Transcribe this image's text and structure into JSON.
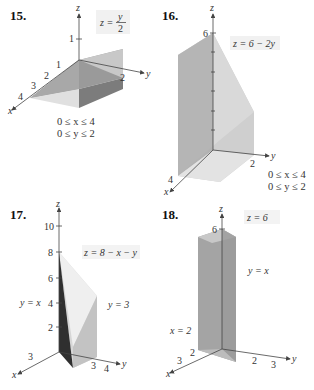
{
  "figures": [
    {
      "number": "15.",
      "equation": "z = y/2",
      "equation_lhs": "z =",
      "equation_num": "y",
      "equation_den": "2",
      "axes": {
        "x": "x",
        "y": "y",
        "z": "z"
      },
      "ticks": {
        "x": [
          "1",
          "2",
          "3",
          "4"
        ],
        "y": [
          "2"
        ],
        "z": [
          "1"
        ]
      },
      "conditions": [
        "0 ≤ x ≤ 4",
        "0 ≤ y ≤ 2"
      ]
    },
    {
      "number": "16.",
      "equation": "z = 6 − 2y",
      "axes": {
        "x": "x",
        "y": "y",
        "z": "z"
      },
      "ticks": {
        "x": [
          "4"
        ],
        "y": [
          "2"
        ],
        "z": [
          "6"
        ]
      },
      "conditions": [
        "0 ≤ x ≤ 4",
        "0 ≤ y ≤ 2"
      ]
    },
    {
      "number": "17.",
      "equation": "z = 8 − x − y",
      "plane_labels": [
        "y = x",
        "y = 3"
      ],
      "axes": {
        "x": "x",
        "y": "y",
        "z": "z"
      },
      "ticks": {
        "x": [
          "3"
        ],
        "y": [
          "3",
          "4"
        ],
        "z": [
          "2",
          "4",
          "6",
          "8",
          "10"
        ]
      }
    },
    {
      "number": "18.",
      "equation": "z = 6",
      "plane_labels": [
        "y = x",
        "x = 2"
      ],
      "axes": {
        "x": "x",
        "y": "y",
        "z": "z"
      },
      "ticks": {
        "x": [
          "2",
          "3"
        ],
        "y": [
          "2",
          "3"
        ],
        "z": [
          "6"
        ]
      }
    }
  ],
  "colors": {
    "face_light": "#e4e4e4",
    "face_mid": "#bdbdbd",
    "face_dark": "#8e8e8e",
    "face_darkest": "#3a3a3a",
    "label_bg": "#f1f1f1"
  }
}
